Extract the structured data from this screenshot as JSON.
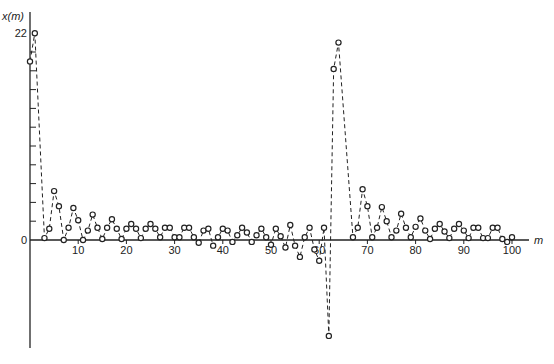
{
  "chart_data": {
    "type": "line",
    "title": "",
    "xlabel": "m",
    "ylabel": "x(m)",
    "xlim": [
      0,
      100
    ],
    "ylim": [
      -10.5,
      22
    ],
    "x_ticks": [
      10,
      20,
      30,
      40,
      50,
      60,
      70,
      80,
      90,
      100
    ],
    "x_tick_labels": [
      "10",
      "20",
      "30",
      "40",
      "50",
      "60",
      "70",
      "80",
      "90",
      "100"
    ],
    "y_ticks": [
      2,
      4,
      6,
      8,
      10,
      12,
      14,
      16,
      18,
      20
    ],
    "y_tick_labels": [
      {
        "value": 0,
        "label": "0"
      },
      {
        "value": 22,
        "label": "22"
      }
    ],
    "grid": false,
    "legend": null,
    "style": {
      "line": "dashed",
      "marker": "open-circle",
      "color": "#222222"
    },
    "series": [
      {
        "name": "x(m)",
        "x": [
          0,
          1,
          3,
          4,
          5,
          6,
          7,
          8,
          9,
          10,
          11,
          12,
          13,
          14,
          15,
          16,
          17,
          18,
          19,
          20,
          21,
          22,
          23,
          24,
          25,
          26,
          27,
          28,
          29,
          30,
          31,
          32,
          33,
          34,
          35,
          36,
          37,
          38,
          39,
          40,
          41,
          42,
          43,
          44,
          45,
          46,
          47,
          48,
          49,
          50,
          51,
          52,
          53,
          54,
          55,
          56,
          57,
          58,
          59,
          60,
          61,
          62,
          63,
          64,
          67,
          68,
          69,
          70,
          71,
          72,
          73,
          74,
          75,
          76,
          77,
          78,
          79,
          80,
          81,
          82,
          83,
          84,
          85,
          86,
          87,
          88,
          89,
          90,
          91,
          92,
          93,
          94,
          95,
          96,
          97,
          98,
          99,
          100
        ],
        "values": [
          19,
          22,
          0.2,
          1.2,
          5.2,
          3.6,
          0,
          1.3,
          3.4,
          2.1,
          0,
          1.0,
          2.7,
          1.3,
          0.1,
          1.3,
          2.2,
          1.2,
          0.1,
          1.2,
          1.7,
          1.2,
          0.2,
          1.2,
          1.7,
          1.2,
          0.3,
          1.3,
          1.3,
          0.3,
          0.3,
          1.3,
          1.3,
          0.3,
          -0.3,
          1.0,
          1.2,
          -0.6,
          0.3,
          1.2,
          1.0,
          -0.2,
          0.5,
          1.3,
          0.8,
          -0.2,
          0.5,
          1.2,
          0.3,
          -0.5,
          1.2,
          0.4,
          -0.8,
          1.6,
          -0.6,
          -1.8,
          0.3,
          1.3,
          -1.0,
          -2.2,
          1.3,
          -10.2,
          18.2,
          21,
          0.3,
          1.3,
          5.4,
          3.6,
          0.3,
          1.3,
          3.5,
          2.0,
          0.3,
          1.0,
          2.8,
          1.3,
          0.3,
          1.4,
          2.3,
          1.0,
          0.1,
          1.2,
          1.7,
          0.9,
          0.2,
          1.2,
          1.7,
          1.0,
          0.2,
          1.3,
          1.3,
          0.2,
          0.2,
          1.3,
          1.3,
          0.1,
          -0.2,
          0.3
        ]
      }
    ]
  }
}
